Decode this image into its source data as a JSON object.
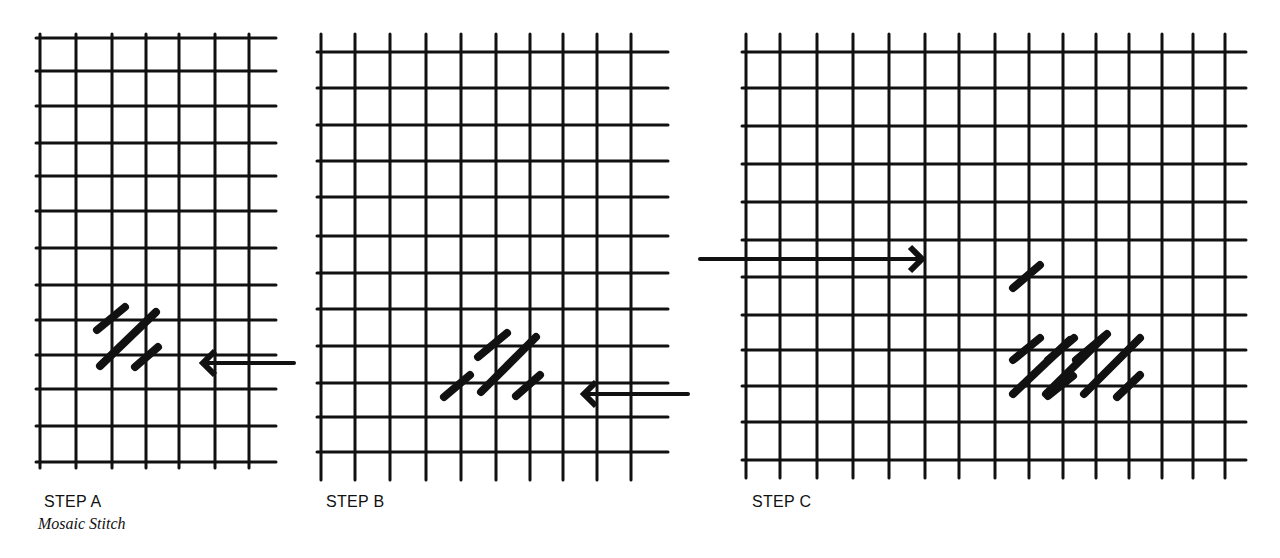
{
  "figure": {
    "title": "Mosaic Stitch",
    "ink_color": "#111111",
    "background": "#ffffff",
    "steps": [
      {
        "id": "A",
        "label": "STEP A",
        "caption": "Mosaic Stitch",
        "grid": {
          "x_lines": [
            40,
            76,
            112,
            146,
            179,
            215,
            249
          ],
          "y_lines": [
            38,
            71,
            106,
            143,
            176,
            211,
            248,
            285,
            320,
            355,
            389,
            426,
            462
          ],
          "x_end": 276,
          "y_start": 34,
          "y_end": 468
        },
        "stitches": [
          {
            "x1": 97,
            "y1": 330,
            "x2": 125,
            "y2": 307
          },
          {
            "x1": 100,
            "y1": 366,
            "x2": 156,
            "y2": 312
          },
          {
            "x1": 135,
            "y1": 367,
            "x2": 158,
            "y2": 347
          }
        ],
        "arrow": {
          "direction": "left",
          "x_tail": 294,
          "x_head": 203,
          "y": 363
        }
      },
      {
        "id": "B",
        "label": "STEP B",
        "grid": {
          "x_lines": [
            321,
            355,
            390,
            426,
            461,
            496,
            530,
            563,
            597,
            631
          ],
          "y_lines": [
            52,
            88,
            125,
            161,
            197,
            236,
            273,
            309,
            346,
            383,
            417,
            452
          ],
          "x_end": 668,
          "y_start": 34,
          "y_end": 480
        },
        "stitches": [
          {
            "x1": 444,
            "y1": 397,
            "x2": 470,
            "y2": 375
          },
          {
            "x1": 478,
            "y1": 357,
            "x2": 507,
            "y2": 333
          },
          {
            "x1": 481,
            "y1": 392,
            "x2": 536,
            "y2": 337
          },
          {
            "x1": 516,
            "y1": 396,
            "x2": 540,
            "y2": 375
          }
        ],
        "arrow": {
          "direction": "left",
          "x_tail": 688,
          "x_head": 584,
          "y": 394
        }
      },
      {
        "id": "C",
        "label": "STEP C",
        "grid": {
          "x_lines": [
            746,
            780,
            817,
            853,
            889,
            925,
            959,
            995,
            1029,
            1063,
            1096,
            1129,
            1162,
            1193,
            1225
          ],
          "y_lines": [
            52,
            88,
            126,
            164,
            202,
            240,
            277,
            315,
            350,
            386,
            422,
            460
          ],
          "x_end": 1246,
          "y_start": 34,
          "y_end": 478
        },
        "stitches": [
          {
            "x1": 1013,
            "y1": 288,
            "x2": 1040,
            "y2": 265
          },
          {
            "x1": 1013,
            "y1": 360,
            "x2": 1040,
            "y2": 338
          },
          {
            "x1": 1013,
            "y1": 394,
            "x2": 1070,
            "y2": 340
          },
          {
            "x1": 1048,
            "y1": 396,
            "x2": 1073,
            "y2": 376
          },
          {
            "x1": 1048,
            "y1": 360,
            "x2": 1074,
            "y2": 338
          },
          {
            "x1": 1046,
            "y1": 394,
            "x2": 1105,
            "y2": 336
          },
          {
            "x1": 1076,
            "y1": 360,
            "x2": 1107,
            "y2": 334
          },
          {
            "x1": 1084,
            "y1": 394,
            "x2": 1140,
            "y2": 338
          },
          {
            "x1": 1117,
            "y1": 397,
            "x2": 1140,
            "y2": 375
          }
        ],
        "arrow": {
          "direction": "right",
          "x_tail": 700,
          "x_head": 922,
          "y": 259
        }
      }
    ]
  }
}
